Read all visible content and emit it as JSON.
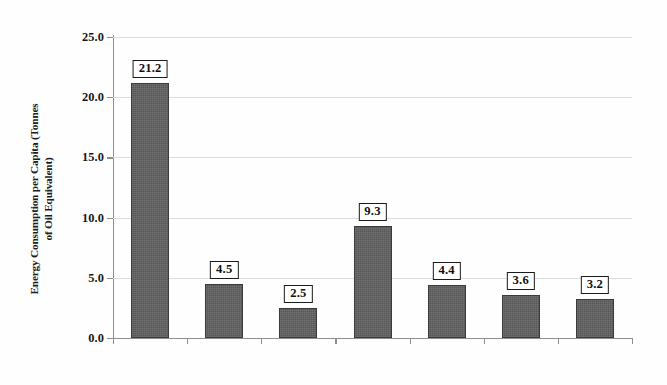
{
  "chart_data": {
    "type": "bar",
    "title": "",
    "xlabel": "",
    "ylabel": "Energy Consumption per Capita (Tonnes of Oil Equivalent)",
    "ylabel_lines": [
      "Energy Consumption per Capita (Tonnes",
      "of Oil Equivalent)"
    ],
    "categories": [
      "Alaska",
      "BC & Terr",
      "Denmark",
      "Iceland",
      "Finland",
      "Norway",
      "Sweden"
    ],
    "values": [
      21.2,
      4.5,
      2.5,
      9.3,
      4.4,
      3.6,
      3.2
    ],
    "data_labels": [
      "21.2",
      "4.5",
      "2.5",
      "9.3",
      "4.4",
      "3.6",
      "3.2"
    ],
    "ylim": [
      0.0,
      25.0
    ],
    "ytick_values": [
      0.0,
      5.0,
      10.0,
      15.0,
      20.0,
      25.0
    ],
    "ytick_labels": [
      "0.0",
      "5.0",
      "10.0",
      "15.0",
      "20.0",
      "25.0"
    ],
    "grid": true,
    "legend": false,
    "bar_color": "#575757",
    "bar_edge_color": "#3a3a3a",
    "gridline_color": "#dcdcdc",
    "axis_color": "#8e8e8e",
    "label_box_border": "#1a1a1a",
    "label_box_fill": "#ffffff",
    "background": "#fefefe"
  }
}
